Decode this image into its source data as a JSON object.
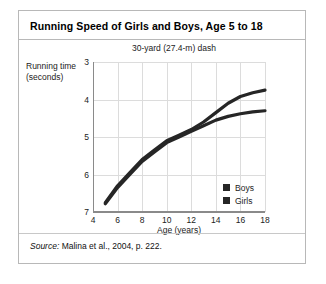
{
  "figure": {
    "title": "Running Speed of Girls and Boys, Age 5 to 18",
    "subtitle": "30-yard (27.4-m) dash",
    "source_word": "Source:",
    "source_text": " Malina et al., 2004, p. 222."
  },
  "colors": {
    "series_line": "#262626",
    "grid": "#dcdcdc",
    "axis": "#8a8a8a",
    "card_border": "#b8b8b8",
    "background": "#ffffff"
  },
  "chart_data": {
    "type": "line",
    "title": "Running Speed of Girls and Boys, Age 5 to 18",
    "subtitle": "30-yard (27.4-m) dash",
    "xlabel": "Age (years)",
    "ylabel": "Running time (seconds)",
    "ylabel_line1": "Running time",
    "ylabel_line2": "(seconds)",
    "xlim": [
      4,
      18
    ],
    "ylim": [
      3,
      7
    ],
    "y_inverted": true,
    "grid": true,
    "legend_position": "inside-bottom-right",
    "xticks": [
      4,
      6,
      8,
      10,
      12,
      14,
      16,
      18
    ],
    "yticks": [
      3,
      4,
      5,
      6,
      7
    ],
    "x": [
      5,
      6,
      7,
      8,
      9,
      10,
      11,
      12,
      13,
      14,
      15,
      16,
      17,
      18
    ],
    "series": [
      {
        "name": "Boys",
        "color": "#262626",
        "values": [
          6.75,
          6.3,
          5.95,
          5.6,
          5.35,
          5.1,
          4.95,
          4.8,
          4.6,
          4.35,
          4.1,
          3.92,
          3.82,
          3.75
        ]
      },
      {
        "name": "Girls",
        "color": "#262626",
        "values": [
          6.78,
          6.35,
          6.0,
          5.65,
          5.4,
          5.15,
          5.0,
          4.85,
          4.7,
          4.55,
          4.45,
          4.38,
          4.33,
          4.3
        ]
      }
    ]
  }
}
